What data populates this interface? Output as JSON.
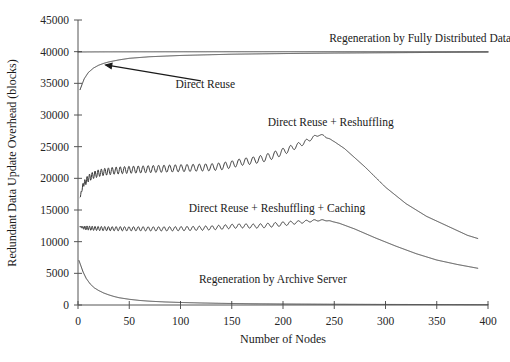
{
  "chart_data": {
    "type": "line",
    "title": "",
    "xlabel": "Number of Nodes",
    "ylabel": "Redundant Data Update Overhead (blocks)",
    "xlim": [
      0,
      400
    ],
    "ylim": [
      0,
      45000
    ],
    "xticks": [
      0,
      50,
      100,
      150,
      200,
      250,
      300,
      350,
      400
    ],
    "yticks": [
      0,
      5000,
      10000,
      15000,
      20000,
      25000,
      30000,
      35000,
      40000,
      45000
    ],
    "grid": false,
    "legend_position": "inline-annotations",
    "series": [
      {
        "name": "Regeneration by Fully Distributed Data",
        "label_x": 245,
        "label_y": 41600,
        "color": "#3a3a3a",
        "x": [
          0,
          10,
          25,
          50,
          75,
          100,
          150,
          200,
          250,
          300,
          350,
          400
        ],
        "values": [
          39950,
          39960,
          39970,
          39975,
          39980,
          39985,
          39990,
          39990,
          39995,
          39995,
          40000,
          40000
        ]
      },
      {
        "name": "Direct Reuse",
        "label_x": 95,
        "label_y": 34200,
        "color": "#3a3a3a",
        "annotation_arrow": {
          "from_x": 120,
          "from_y": 35400,
          "to_x": 27,
          "to_y": 37900
        },
        "x": [
          2,
          6,
          10,
          15,
          20,
          25,
          30,
          40,
          50,
          70,
          100,
          150,
          200,
          250,
          300,
          350,
          400
        ],
        "values": [
          34000,
          35700,
          36700,
          37400,
          37850,
          38150,
          38380,
          38700,
          38950,
          39200,
          39400,
          39600,
          39700,
          39780,
          39830,
          39880,
          39920
        ]
      },
      {
        "name": "Direct Reuse + Reshuffling",
        "label_x": 185,
        "label_y": 28200,
        "color": "#3a3a3a",
        "peak_x": 235,
        "peak_value": 26900,
        "x": [
          2,
          5,
          10,
          15,
          20,
          25,
          30,
          35,
          40,
          50,
          60,
          70,
          80,
          90,
          100,
          110,
          120,
          130,
          140,
          150,
          160,
          170,
          180,
          190,
          200,
          210,
          220,
          230,
          235,
          240,
          250,
          260,
          280,
          300,
          320,
          340,
          360,
          380,
          390
        ],
        "values": [
          17000,
          19000,
          20000,
          20500,
          20800,
          21000,
          21100,
          21200,
          21250,
          21350,
          21400,
          21450,
          21500,
          21550,
          21600,
          21650,
          21700,
          21750,
          21900,
          22200,
          22600,
          22800,
          23100,
          23600,
          24200,
          24900,
          25600,
          26500,
          26900,
          26700,
          25800,
          24700,
          21800,
          18600,
          16000,
          14000,
          12500,
          11000,
          10500
        ]
      },
      {
        "name": "Direct Reuse + Reshuffling + Caching",
        "label_x": 108,
        "label_y": 14700,
        "color": "#3a3a3a",
        "peak_x": 238,
        "peak_value": 13400,
        "x": [
          2,
          5,
          10,
          15,
          20,
          25,
          30,
          40,
          50,
          60,
          70,
          80,
          90,
          100,
          110,
          120,
          130,
          140,
          150,
          160,
          170,
          180,
          190,
          200,
          210,
          220,
          230,
          238,
          245,
          255,
          270,
          290,
          310,
          330,
          350,
          370,
          390
        ],
        "values": [
          12400,
          12200,
          12150,
          12100,
          12080,
          12060,
          12050,
          12040,
          12030,
          12030,
          12020,
          12020,
          12030,
          12050,
          12080,
          12120,
          12180,
          12280,
          12420,
          12500,
          12450,
          12500,
          12650,
          12800,
          13000,
          13150,
          13330,
          13400,
          13300,
          12900,
          12000,
          10600,
          9300,
          8100,
          7100,
          6400,
          5800
        ]
      },
      {
        "name": "Regeneration by Archive Server",
        "label_x": 118,
        "label_y": 3400,
        "color": "#3a3a3a",
        "x": [
          1,
          3,
          5,
          8,
          12,
          16,
          20,
          25,
          30,
          35,
          40,
          50,
          60,
          70,
          85,
          100,
          120,
          140,
          170,
          200,
          250,
          300,
          350,
          400
        ],
        "values": [
          7000,
          6100,
          5200,
          4200,
          3300,
          2700,
          2300,
          1900,
          1600,
          1350,
          1150,
          900,
          720,
          600,
          480,
          400,
          320,
          260,
          200,
          160,
          120,
          90,
          70,
          50
        ]
      }
    ]
  }
}
